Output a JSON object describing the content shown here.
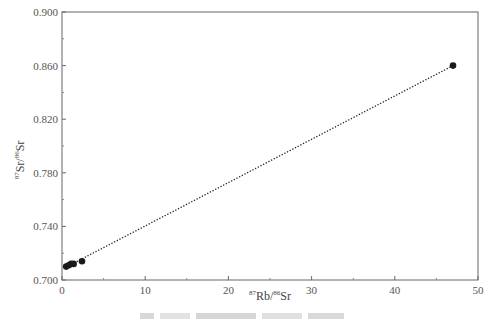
{
  "chart_data": {
    "type": "scatter",
    "title": "",
    "xlabel": "87Rb/86Sr",
    "ylabel": "87Sr/86Sr",
    "xlim": [
      0,
      50
    ],
    "ylim": [
      0.7,
      0.9
    ],
    "x_ticks": [
      0,
      10,
      20,
      30,
      40,
      50
    ],
    "y_ticks": [
      "0.700",
      "0.740",
      "0.780",
      "0.820",
      "0.860",
      "0.900"
    ],
    "grid": false,
    "series": [
      {
        "name": "samples",
        "marker": "circle",
        "color": "#1a1a1a",
        "points": [
          {
            "x": 0.5,
            "y": 0.71
          },
          {
            "x": 0.8,
            "y": 0.711
          },
          {
            "x": 1.1,
            "y": 0.712
          },
          {
            "x": 1.4,
            "y": 0.712
          },
          {
            "x": 2.4,
            "y": 0.714
          },
          {
            "x": 47.0,
            "y": 0.86
          }
        ]
      },
      {
        "name": "isochron fit",
        "line_style": "dotted",
        "color": "#222222",
        "points": [
          {
            "x": 0.5,
            "y": 0.7096
          },
          {
            "x": 47.0,
            "y": 0.86
          }
        ]
      }
    ],
    "caption": "图 — 样品Rb-Sr等时线图 (blurred, illegible)"
  },
  "axes": {
    "x_superscript_1": "87",
    "x_base_1": "Rb/",
    "x_superscript_2": "86",
    "x_base_2": "Sr",
    "y_superscript_1": "87",
    "y_base_1": "Sr/",
    "y_superscript_2": "86",
    "y_base_2": "Sr"
  }
}
